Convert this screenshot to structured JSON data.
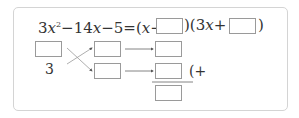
{
  "problem": {
    "lhs": "3x²−14x−5",
    "equation_parts": {
      "coef_lead": "3",
      "var1": "x",
      "exp": "2",
      "minus14": "−14",
      "var2": "x",
      "minus5": "−5=(",
      "var3": "x",
      "minus": "−",
      "mid": ")(3",
      "var4": "x",
      "plus": "+",
      "close": ")"
    },
    "cross": {
      "left_bottom_number": "3"
    },
    "sum_fragment": "(+"
  }
}
